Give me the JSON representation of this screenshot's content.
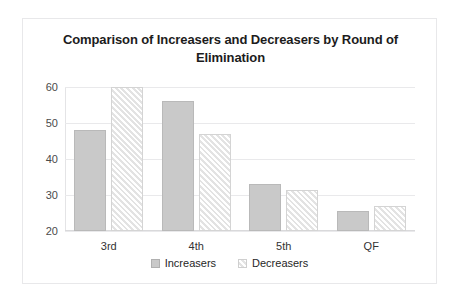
{
  "chart_data": {
    "type": "bar",
    "title": "Comparison of Increasers and Decreasers by Round of Elimination",
    "xlabel": "",
    "ylabel": "",
    "categories": [
      "3rd",
      "4th",
      "5th",
      "QF"
    ],
    "series": [
      {
        "name": "Increasers",
        "values": [
          48,
          56,
          33,
          25.5
        ],
        "color": "#c9c9c9",
        "fill": "solid"
      },
      {
        "name": "Decreasers",
        "values": [
          60,
          47,
          31.5,
          27
        ],
        "color": "#e3e3e3",
        "fill": "diagonal-hatch"
      }
    ],
    "ylim": [
      20,
      60
    ],
    "yticks": [
      20,
      30,
      40,
      50,
      60
    ],
    "ytick_labels": [
      "20",
      "30",
      "40",
      "50",
      "60"
    ],
    "grid": true,
    "legend_position": "bottom"
  },
  "frame": {
    "border_color": "#e8e8ea",
    "background": "#ffffff"
  }
}
